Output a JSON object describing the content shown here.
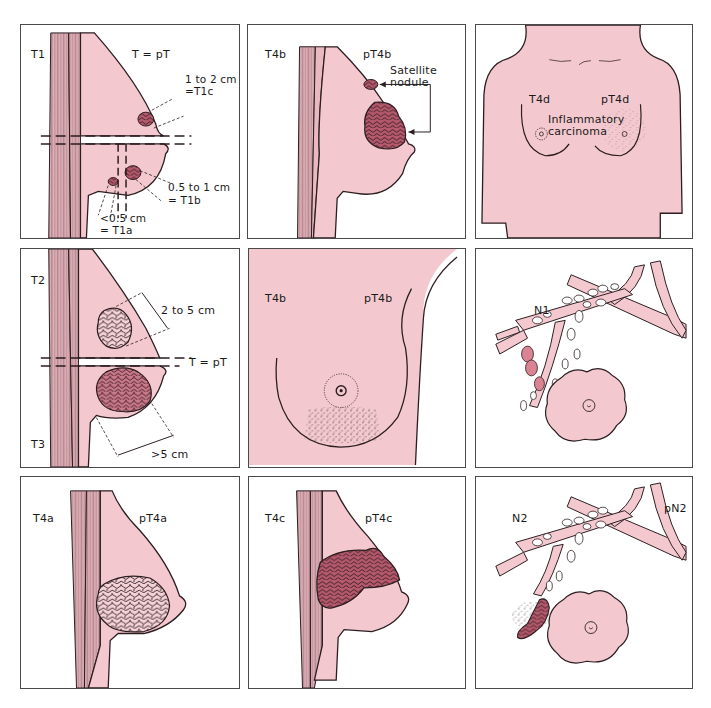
{
  "figure": {
    "colors": {
      "tissue_pink": "#f3c9cf",
      "tissue_pink_light": "#f6d3d8",
      "tumor_dark": "#9e4a5c",
      "node_involved": "#d98393",
      "outline": "#2b1d20",
      "border": "#4a4a4a"
    },
    "panels": [
      {
        "id": "t1",
        "stage_label": "T1",
        "equivalence_label": "T = pT",
        "annotations": {
          "t1c_size": "1 to 2 cm",
          "t1c_code": "=T1c",
          "t1b_size": "0.5 to 1 cm",
          "t1b_code": "= T1b",
          "t1a_size": "<0.5 cm",
          "t1a_code": "= T1a"
        }
      },
      {
        "id": "t4b-satellite",
        "stage_label": "T4b",
        "pathologic_label": "pT4b",
        "annotation_line1": "Satellite",
        "annotation_line2": "nodule"
      },
      {
        "id": "t4d",
        "stage_label": "T4d",
        "pathologic_label": "pT4d",
        "annotation_line1": "Inflammatory",
        "annotation_line2": "carcinoma"
      },
      {
        "id": "t2-t3",
        "stage_label_top": "T2",
        "stage_label_bottom": "T3",
        "equivalence_label": "T = pT",
        "t2_size": "2 to 5 cm",
        "t3_size": ">5 cm"
      },
      {
        "id": "t4b-skin",
        "stage_label": "T4b",
        "pathologic_label": "pT4b"
      },
      {
        "id": "n1",
        "stage_label": "N1"
      },
      {
        "id": "t4a",
        "stage_label": "T4a",
        "pathologic_label": "pT4a"
      },
      {
        "id": "t4c",
        "stage_label": "T4c",
        "pathologic_label": "pT4c"
      },
      {
        "id": "n2",
        "stage_label": "N2",
        "pathologic_label": "pN2"
      }
    ]
  }
}
